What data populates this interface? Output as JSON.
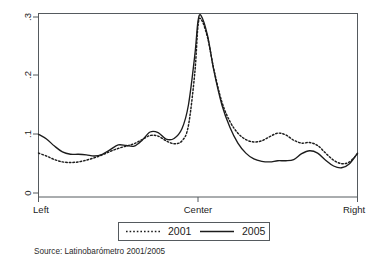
{
  "chart_data": {
    "type": "line",
    "title": "",
    "subtitle": "",
    "xlabel": "",
    "ylabel": "",
    "grid": false,
    "legend_position": "bottom",
    "xlim": [
      0,
      1
    ],
    "ylim": [
      0,
      0.32
    ],
    "x_tick_labels": [
      "Left",
      "Center",
      "Right"
    ],
    "x_tick_values": [
      0,
      0.5,
      1
    ],
    "y_tick_labels": [
      "0",
      ".1",
      ".2",
      ".3"
    ],
    "y_tick_values": [
      0,
      0.1,
      0.2,
      0.3
    ],
    "annotation": "Source: Latinobarómetro 2001/2005",
    "series": [
      {
        "name": "2001",
        "style": "dotted",
        "color": "#1c1c1c",
        "x": [
          0.0,
          0.025,
          0.05,
          0.075,
          0.1,
          0.125,
          0.15,
          0.175,
          0.2,
          0.225,
          0.25,
          0.275,
          0.3,
          0.325,
          0.35,
          0.375,
          0.4,
          0.425,
          0.45,
          0.47,
          0.49,
          0.5,
          0.51,
          0.53,
          0.55,
          0.575,
          0.6,
          0.625,
          0.65,
          0.675,
          0.7,
          0.725,
          0.75,
          0.775,
          0.8,
          0.825,
          0.85,
          0.875,
          0.9,
          0.925,
          0.95,
          0.975,
          1.0
        ],
        "y": [
          0.068,
          0.063,
          0.057,
          0.053,
          0.052,
          0.053,
          0.056,
          0.06,
          0.065,
          0.071,
          0.076,
          0.08,
          0.084,
          0.091,
          0.098,
          0.097,
          0.089,
          0.084,
          0.089,
          0.115,
          0.205,
          0.285,
          0.296,
          0.265,
          0.21,
          0.155,
          0.122,
          0.102,
          0.091,
          0.087,
          0.089,
          0.096,
          0.102,
          0.099,
          0.09,
          0.085,
          0.086,
          0.081,
          0.068,
          0.056,
          0.05,
          0.053,
          0.067
        ]
      },
      {
        "name": "2005",
        "style": "solid",
        "color": "#1c1c1c",
        "x": [
          0.0,
          0.025,
          0.05,
          0.075,
          0.1,
          0.125,
          0.15,
          0.175,
          0.2,
          0.225,
          0.25,
          0.275,
          0.3,
          0.325,
          0.35,
          0.375,
          0.4,
          0.425,
          0.45,
          0.47,
          0.49,
          0.5,
          0.51,
          0.53,
          0.55,
          0.575,
          0.6,
          0.625,
          0.65,
          0.675,
          0.7,
          0.725,
          0.75,
          0.775,
          0.8,
          0.825,
          0.85,
          0.875,
          0.9,
          0.925,
          0.95,
          0.975,
          1.0
        ],
        "y": [
          0.1,
          0.092,
          0.08,
          0.07,
          0.066,
          0.066,
          0.065,
          0.063,
          0.066,
          0.074,
          0.082,
          0.081,
          0.08,
          0.09,
          0.104,
          0.103,
          0.092,
          0.093,
          0.11,
          0.15,
          0.235,
          0.293,
          0.302,
          0.268,
          0.208,
          0.15,
          0.112,
          0.085,
          0.068,
          0.058,
          0.054,
          0.053,
          0.055,
          0.055,
          0.057,
          0.067,
          0.072,
          0.068,
          0.056,
          0.046,
          0.043,
          0.05,
          0.068
        ]
      }
    ]
  },
  "axes": {
    "y_ticks": [
      {
        "label": ".3",
        "value": 0.3
      },
      {
        "label": ".2",
        "value": 0.2
      },
      {
        "label": ".1",
        "value": 0.1
      },
      {
        "label": "0",
        "value": 0
      }
    ],
    "x_ticks": [
      {
        "label": "Left",
        "value": 0
      },
      {
        "label": "Center",
        "value": 0.5
      },
      {
        "label": "Right",
        "value": 1
      }
    ]
  },
  "legend": {
    "entries": [
      {
        "label": "2001",
        "style": "dotted"
      },
      {
        "label": "2005",
        "style": "solid"
      }
    ]
  },
  "caption": {
    "source": "Source: Latinobarómetro 2001/2005"
  },
  "colors": {
    "line": "#1c1c1c",
    "frame": "#555a5e",
    "background": "#ffffff"
  }
}
